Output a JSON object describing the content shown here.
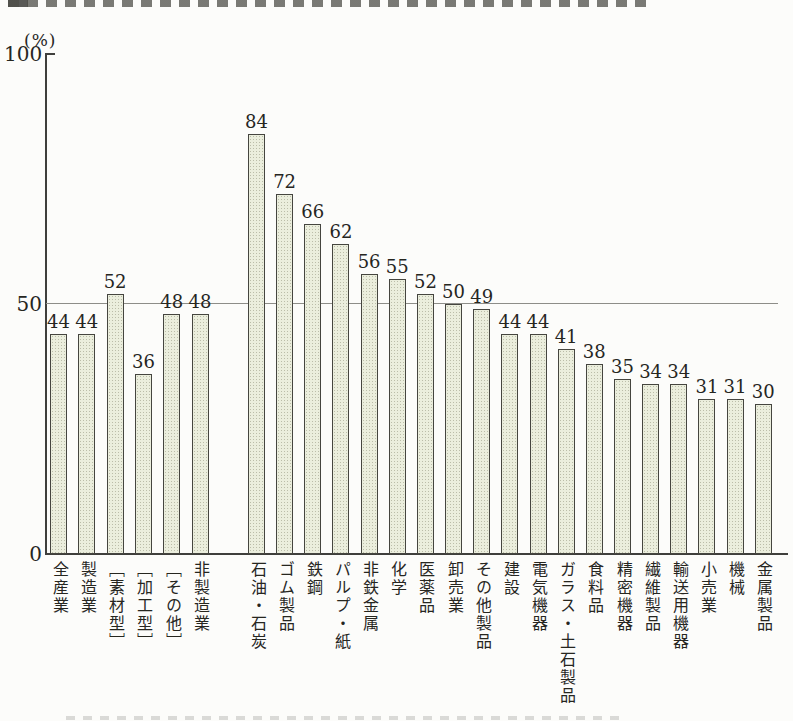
{
  "page": {
    "background": "#fcfcfa",
    "artifacts": {
      "top_cropped_text_line": true,
      "bottom_cropped_text_line": true
    }
  },
  "chart_data": {
    "type": "bar",
    "title": "",
    "unit_label": "(%)",
    "ylim": [
      0,
      100
    ],
    "yticks": [
      {
        "value": 100,
        "label": "100"
      },
      {
        "value": 50,
        "label": "50"
      },
      {
        "value": 0,
        "label": "0"
      }
    ],
    "gridlines": [
      50
    ],
    "grid_on": true,
    "legend": null,
    "gap_after_index": 5,
    "categories": [
      "全産業",
      "製造業",
      "［素材型］",
      "［加工型］",
      "［その他］",
      "非製造業",
      "石油・石炭",
      "ゴム製品",
      "鉄鋼",
      "パルプ・紙",
      "非鉄金属",
      "化学",
      "医薬品",
      "卸売業",
      "その他製品",
      "建設",
      "電気機器",
      "ガラス・土石製品",
      "食料品",
      "精密機器",
      "繊維製品",
      "輸送用機器",
      "小売業",
      "機械",
      "金属製品"
    ],
    "values": [
      44,
      44,
      52,
      36,
      48,
      48,
      84,
      72,
      66,
      62,
      56,
      55,
      52,
      50,
      49,
      44,
      44,
      41,
      38,
      35,
      34,
      34,
      31,
      31,
      30
    ],
    "colors": {
      "bar_fill": "#ebeedd",
      "bar_border": "#45453f",
      "axis": "#3f3f3c",
      "grid": "#8d8d88",
      "text": "#26261f"
    }
  }
}
